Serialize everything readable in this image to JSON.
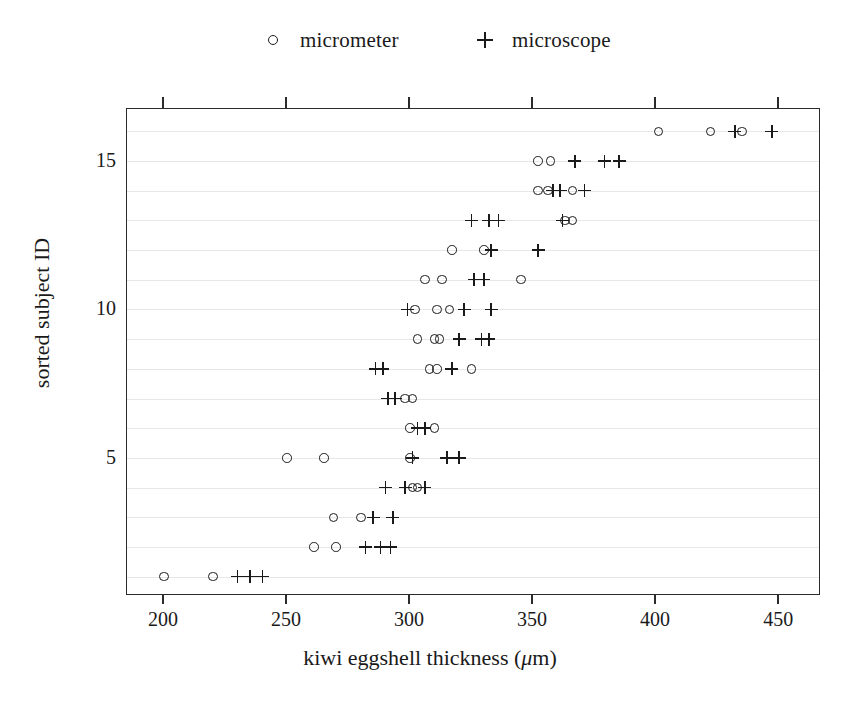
{
  "chart_data": {
    "type": "scatter",
    "title": "",
    "xlabel": "kiwi eggshell thickness (μm)",
    "ylabel": "sorted subject ID",
    "xlim": [
      185,
      467
    ],
    "ylim": [
      0.35,
      16.75
    ],
    "xticks": [
      200,
      250,
      300,
      350,
      400,
      450
    ],
    "xticklabels": [
      "200",
      "250",
      "300",
      "350",
      "400",
      "450"
    ],
    "yticks": [
      5,
      10,
      15
    ],
    "yticklabels": [
      "5",
      "10",
      "15"
    ],
    "grid": "horizontal-light",
    "legend_position": "top-center",
    "series": [
      {
        "name": "micrometer",
        "marker": "circle",
        "points": [
          {
            "y": 1,
            "x": 200
          },
          {
            "y": 1,
            "x": 220
          },
          {
            "y": 2,
            "x": 261
          },
          {
            "y": 2,
            "x": 270
          },
          {
            "y": 3,
            "x": 269
          },
          {
            "y": 3,
            "x": 280
          },
          {
            "y": 4,
            "x": 301
          },
          {
            "y": 4,
            "x": 303
          },
          {
            "y": 5,
            "x": 250
          },
          {
            "y": 5,
            "x": 265
          },
          {
            "y": 5,
            "x": 300
          },
          {
            "y": 6,
            "x": 300
          },
          {
            "y": 6,
            "x": 310
          },
          {
            "y": 7,
            "x": 298
          },
          {
            "y": 7,
            "x": 301
          },
          {
            "y": 8,
            "x": 308
          },
          {
            "y": 8,
            "x": 311
          },
          {
            "y": 8,
            "x": 325
          },
          {
            "y": 9,
            "x": 303
          },
          {
            "y": 9,
            "x": 310
          },
          {
            "y": 9,
            "x": 312
          },
          {
            "y": 10,
            "x": 302
          },
          {
            "y": 10,
            "x": 311
          },
          {
            "y": 10,
            "x": 316
          },
          {
            "y": 11,
            "x": 306
          },
          {
            "y": 11,
            "x": 313
          },
          {
            "y": 11,
            "x": 345
          },
          {
            "y": 12,
            "x": 317
          },
          {
            "y": 12,
            "x": 330
          },
          {
            "y": 13,
            "x": 363
          },
          {
            "y": 13,
            "x": 366
          },
          {
            "y": 14,
            "x": 352
          },
          {
            "y": 14,
            "x": 356
          },
          {
            "y": 14,
            "x": 366
          },
          {
            "y": 15,
            "x": 352
          },
          {
            "y": 15,
            "x": 357
          },
          {
            "y": 16,
            "x": 401
          },
          {
            "y": 16,
            "x": 422
          },
          {
            "y": 16,
            "x": 435
          }
        ]
      },
      {
        "name": "microscope",
        "marker": "plus",
        "points": [
          {
            "y": 1,
            "x": 230
          },
          {
            "y": 1,
            "x": 235
          },
          {
            "y": 1,
            "x": 240
          },
          {
            "y": 2,
            "x": 282
          },
          {
            "y": 2,
            "x": 288
          },
          {
            "y": 2,
            "x": 292
          },
          {
            "y": 3,
            "x": 285
          },
          {
            "y": 3,
            "x": 293
          },
          {
            "y": 4,
            "x": 290
          },
          {
            "y": 4,
            "x": 298
          },
          {
            "y": 4,
            "x": 306
          },
          {
            "y": 5,
            "x": 301
          },
          {
            "y": 5,
            "x": 315
          },
          {
            "y": 5,
            "x": 320
          },
          {
            "y": 6,
            "x": 303
          },
          {
            "y": 6,
            "x": 306
          },
          {
            "y": 7,
            "x": 291
          },
          {
            "y": 7,
            "x": 294
          },
          {
            "y": 8,
            "x": 286
          },
          {
            "y": 8,
            "x": 289
          },
          {
            "y": 8,
            "x": 317
          },
          {
            "y": 9,
            "x": 320
          },
          {
            "y": 9,
            "x": 329
          },
          {
            "y": 9,
            "x": 332
          },
          {
            "y": 10,
            "x": 299
          },
          {
            "y": 10,
            "x": 322
          },
          {
            "y": 10,
            "x": 333
          },
          {
            "y": 11,
            "x": 326
          },
          {
            "y": 11,
            "x": 330
          },
          {
            "y": 12,
            "x": 333
          },
          {
            "y": 12,
            "x": 352
          },
          {
            "y": 13,
            "x": 325
          },
          {
            "y": 13,
            "x": 332
          },
          {
            "y": 13,
            "x": 336
          },
          {
            "y": 13,
            "x": 362
          },
          {
            "y": 14,
            "x": 358
          },
          {
            "y": 14,
            "x": 361
          },
          {
            "y": 14,
            "x": 371
          },
          {
            "y": 15,
            "x": 367
          },
          {
            "y": 15,
            "x": 379
          },
          {
            "y": 15,
            "x": 385
          },
          {
            "y": 16,
            "x": 432
          },
          {
            "y": 16,
            "x": 447
          }
        ]
      }
    ]
  },
  "legend": {
    "entries": [
      {
        "label": "micrometer",
        "marker": "circle"
      },
      {
        "label": "microscope",
        "marker": "plus"
      }
    ]
  },
  "axis": {
    "x_title_prefix": "kiwi eggshell thickness (",
    "x_title_mu": "μ",
    "x_title_suffix": "m)",
    "y_title": "sorted subject ID"
  }
}
